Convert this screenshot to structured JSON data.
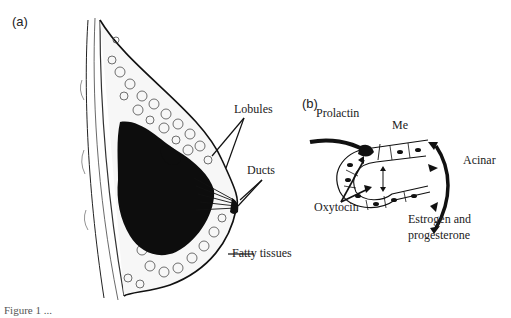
{
  "figure": {
    "panel_a": {
      "label": "(a)",
      "annotations": [
        "Lobules",
        "Ducts",
        "Fatty tissues"
      ]
    },
    "panel_b": {
      "label": "(b)",
      "annotations": [
        "Prolactin",
        "Me",
        "Acinar",
        "Oxytocin",
        "Estrogen and",
        "progesterone"
      ]
    },
    "caption": "Figure 1 ..."
  }
}
